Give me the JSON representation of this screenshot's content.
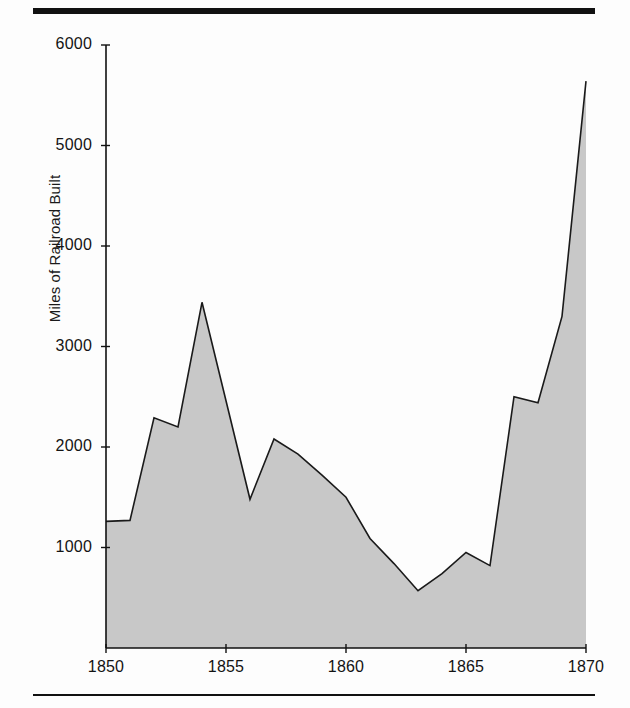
{
  "figure": {
    "ylabel": "Miles of Railroad Built",
    "top_rule": "top-rule",
    "bottom_rule": "bottom-rule"
  },
  "chart_data": {
    "type": "area",
    "title": "",
    "xlabel": "",
    "ylabel": "Miles of Railroad Built",
    "xlim": [
      1850,
      1870
    ],
    "ylim": [
      0,
      6000
    ],
    "xticks": [
      1850,
      1855,
      1860,
      1865,
      1870
    ],
    "xtick_labels": [
      "1850",
      "1855",
      "1860",
      "1865",
      "1870"
    ],
    "yticks": [
      1000,
      2000,
      3000,
      4000,
      5000,
      6000
    ],
    "ytick_labels": [
      "1000",
      "2000",
      "3000",
      "4000",
      "5000",
      "6000"
    ],
    "grid": false,
    "legend": null,
    "fill_color": "#c8c8c8",
    "line_color": "#1a1a1a",
    "x": [
      1850,
      1851,
      1852,
      1853,
      1854,
      1855,
      1856,
      1857,
      1858,
      1859,
      1860,
      1861,
      1862,
      1863,
      1864,
      1865,
      1866,
      1867,
      1868,
      1869,
      1870
    ],
    "values": [
      1260,
      1270,
      2290,
      2200,
      3440,
      2460,
      1480,
      2080,
      1930,
      1720,
      1500,
      1090,
      840,
      570,
      740,
      950,
      820,
      2500,
      2440,
      3300,
      5640
    ],
    "series": [
      {
        "name": "Miles of Railroad Built",
        "values": [
          1260,
          1270,
          2290,
          2200,
          3440,
          2460,
          1480,
          2080,
          1930,
          1720,
          1500,
          1090,
          840,
          570,
          740,
          950,
          820,
          2500,
          2440,
          3300,
          5640
        ]
      }
    ]
  }
}
